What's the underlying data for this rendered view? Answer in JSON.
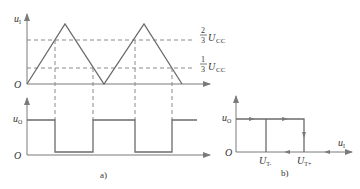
{
  "figure_a": {
    "caption": "a)",
    "top_plot": {
      "y_label": "u",
      "y_label_sub": "I",
      "origin_label": "O",
      "thresholds": [
        {
          "num": "2",
          "den": "3",
          "sym": "U",
          "sub": "CC"
        },
        {
          "num": "1",
          "den": "3",
          "sym": "U",
          "sub": "CC"
        }
      ]
    },
    "bottom_plot": {
      "y_label": "u",
      "y_label_sub": "O",
      "origin_label": "O"
    }
  },
  "figure_b": {
    "caption": "b)",
    "y_label": "u",
    "y_label_sub": "O",
    "x_label": "u",
    "x_label_sub": "I",
    "origin_label": "O",
    "tick_left": {
      "sym": "U",
      "sub": "T-"
    },
    "tick_right": {
      "sym": "U",
      "sub": "T+"
    }
  },
  "colors": {
    "line": "#6b6b6b",
    "dash": "#8a8a8a",
    "text": "#333333"
  }
}
